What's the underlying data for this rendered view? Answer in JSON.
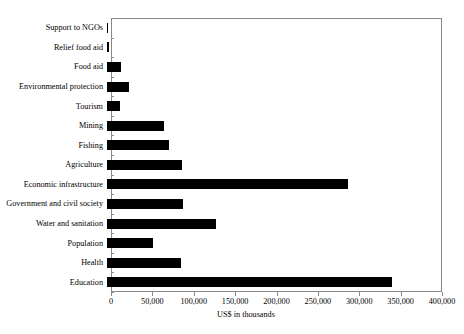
{
  "chart_data": {
    "type": "bar",
    "orientation": "horizontal",
    "title": "",
    "xlabel": "US$ in thousands",
    "ylabel": "",
    "xlim": [
      0,
      400000
    ],
    "xticks": [
      "0",
      "50,000",
      "100,000",
      "150,000",
      "200,000",
      "250,000",
      "300,000",
      "350,000",
      "400,000"
    ],
    "xtick_values": [
      0,
      50000,
      100000,
      150000,
      200000,
      250000,
      300000,
      350000,
      400000
    ],
    "grid": false,
    "legend": null,
    "bar_color": "#000000",
    "categories": [
      "Support to NGOs",
      "Relief food aid",
      "Food aid",
      "Environmental protection",
      "Tourism",
      "Mining",
      "Fishing",
      "Agriculture",
      "Economic infrastructure",
      "Government and civil society",
      "Water and sanitation",
      "Population",
      "Health",
      "Education"
    ],
    "values": [
      1000,
      2000,
      17000,
      27000,
      16000,
      69000,
      75000,
      91000,
      291000,
      92000,
      132000,
      56000,
      89000,
      344000
    ]
  }
}
